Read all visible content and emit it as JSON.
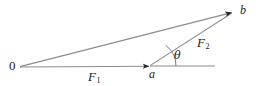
{
  "figure": {
    "type": "vector-addition-diagram",
    "background_color": "#ffffff",
    "line_color": "#808080",
    "arrow_color": "#262626",
    "text_color": "#1a1a1a",
    "width": 256,
    "height": 86
  },
  "points": [
    {
      "id": "origin",
      "label": "0",
      "x": 20,
      "y": 67
    },
    {
      "id": "a",
      "label": "a",
      "x": 150,
      "y": 66
    },
    {
      "id": "b",
      "label": "b",
      "x": 233,
      "y": 12
    }
  ],
  "vectors": [
    {
      "id": "f1",
      "label": "F",
      "subscript": "1",
      "from": "origin",
      "to": "a",
      "x1": 20,
      "y1": 67,
      "x2": 150,
      "y2": 66,
      "arrowhead": true,
      "label_x": 95,
      "label_y": 77
    },
    {
      "id": "f2",
      "label": "F",
      "subscript": "2",
      "from": "a",
      "to": "b",
      "x1": 150,
      "y1": 66,
      "x2": 233,
      "y2": 12,
      "arrowhead": false,
      "label_x": 205,
      "label_y": 43
    },
    {
      "id": "resultant",
      "label": "",
      "subscript": "",
      "from": "origin",
      "to": "b",
      "x1": 20,
      "y1": 67,
      "x2": 233,
      "y2": 12,
      "arrowhead": true,
      "label_x": 0,
      "label_y": 0
    }
  ],
  "reference_line": {
    "id": "horizontal-reference",
    "x1": 150,
    "y1": 66,
    "x2": 215,
    "y2": 66
  },
  "angle": {
    "id": "theta",
    "symbol": "θ",
    "vertex": "a",
    "between": [
      "f2",
      "horizontal-reference"
    ],
    "arc_radius": 26,
    "label_x": 177,
    "label_y": 56
  }
}
